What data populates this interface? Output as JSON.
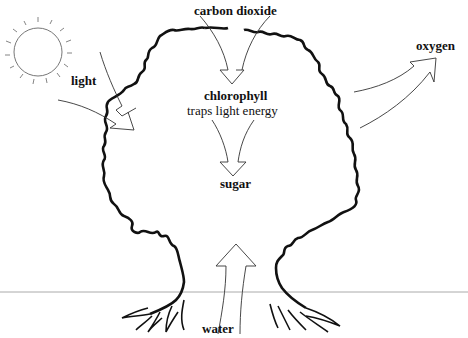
{
  "diagram": {
    "labels": {
      "carbon_dioxide": "carbon dioxide",
      "light": "light",
      "chlorophyll": "chlorophyll",
      "chlorophyll_desc": "traps light energy",
      "sugar": "sugar",
      "oxygen": "oxygen",
      "water": "water"
    },
    "colors": {
      "outline": "#111111",
      "arrow": "#333333",
      "sun": "#777777",
      "ground": "#aaaaaa",
      "background": "#ffffff"
    },
    "flows": [
      {
        "from": "air",
        "to": "chlorophyll",
        "substance": "carbon dioxide"
      },
      {
        "from": "sun",
        "to": "chlorophyll",
        "substance": "light"
      },
      {
        "from": "chlorophyll",
        "to": "sugar",
        "substance": "energy"
      },
      {
        "from": "tree",
        "to": "air",
        "substance": "oxygen"
      },
      {
        "from": "roots",
        "to": "tree",
        "substance": "water"
      }
    ]
  }
}
